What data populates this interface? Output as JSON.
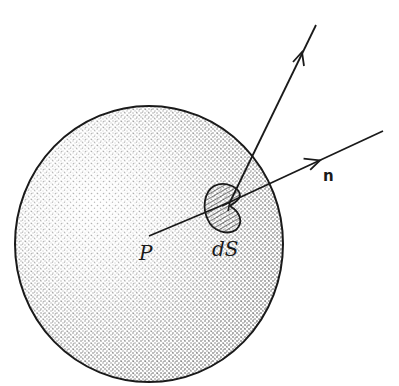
{
  "figure": {
    "labels": {
      "point": "P",
      "surface_element": "dS",
      "normal": "n"
    },
    "colors": {
      "ink": "#1a1a1a",
      "background": "#ffffff"
    }
  }
}
